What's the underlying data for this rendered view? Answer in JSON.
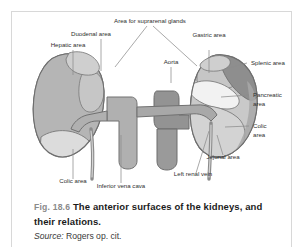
{
  "figure": {
    "number": "Fig. 18.6",
    "title": "The anterior surfaces of the kidneys, and their relations.",
    "source_label": "Source:",
    "source_text": "Rogers op. cit."
  },
  "diagram": {
    "labels": {
      "suprarenal": "Area for suprarenal glands",
      "duodenal": "Duodenal area",
      "hepatic": "Hepatic area",
      "gastric": "Gastric area",
      "splenic": "Splenic area",
      "aorta": "Aorta",
      "pancreatic_l1": "Pancreatic",
      "pancreatic_l2": "area",
      "colic_right_l1": "Colic",
      "colic_right_l2": "area",
      "jejunal": "Jejunal area",
      "left_renal_vein": "Left renal vein",
      "inferior_vena_cava": "Inferior vena cava",
      "colic_left": "Colic area"
    },
    "colors": {
      "kidney_outline": "#6e6e6e",
      "hepatic_fill": "#b5b5b5",
      "gastric_fill": "#c6c6c6",
      "splenic_fill": "#8e8e8e",
      "pancreatic_fill": "#f2f2f2",
      "colic_fill": "#dcdcdc",
      "suprarenal_fill": "#cfcfcf",
      "vessel_fill": "#b0b0b0",
      "vessel_dark_fill": "#939393",
      "leader_line": "#8c8c8c",
      "label_text": "#2e2e2e"
    }
  }
}
